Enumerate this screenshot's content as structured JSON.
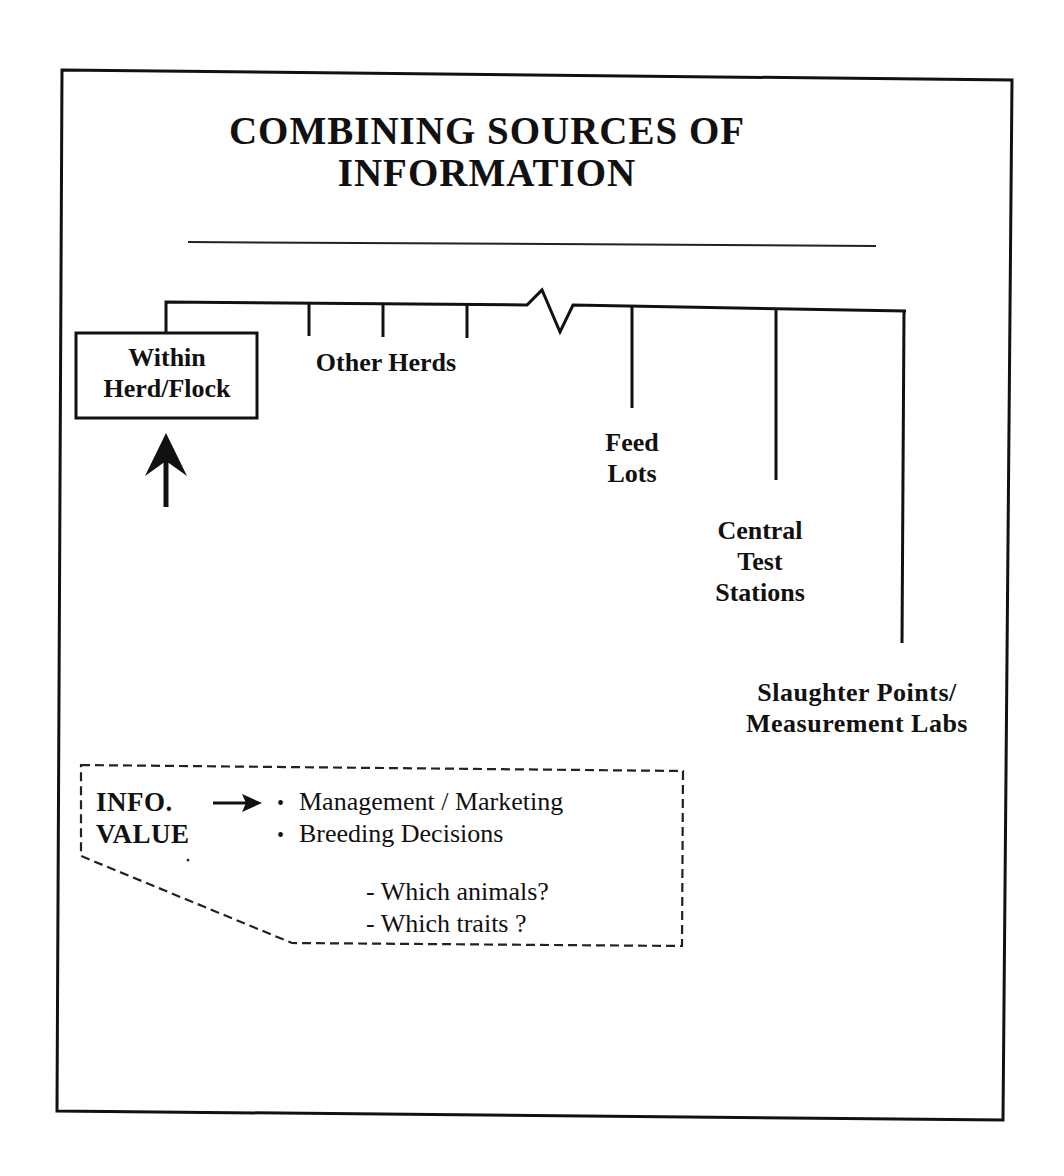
{
  "diagram": {
    "title_line1": "COMBINING SOURCES OF",
    "title_line2": "INFORMATION",
    "sources": {
      "within": {
        "line1": "Within",
        "line2": "Herd/Flock",
        "highlighted": true
      },
      "other_herds": "Other Herds",
      "feed_lots": {
        "line1": "Feed",
        "line2": "Lots"
      },
      "central_test": {
        "line1": "Central",
        "line2": "Test",
        "line3": "Stations"
      },
      "slaughter": {
        "line1": "Slaughter Points/",
        "line2": "Measurement Labs"
      }
    },
    "info_box": {
      "label_line1": "INFO.",
      "label_line2": "VALUE",
      "arrow_icon": "right-arrow-icon",
      "bullet_glyph": "•",
      "items": [
        "Management / Marketing",
        "Breeding Decisions"
      ],
      "sub_items": [
        "- Which animals?",
        "- Which traits ?"
      ]
    },
    "colors": {
      "ink": "#111111",
      "paper": "#ffffff"
    }
  }
}
